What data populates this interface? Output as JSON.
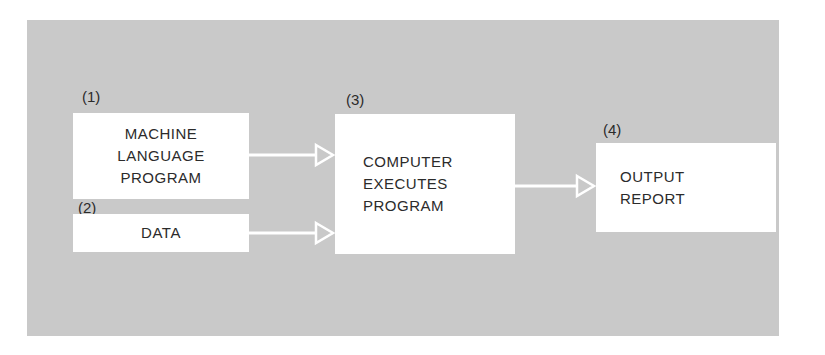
{
  "diagram": {
    "type": "flowchart",
    "background_color": "#c9c9c9",
    "box_color": "#ffffff",
    "arrow_color": "#ffffff",
    "nodes": [
      {
        "id": "1",
        "number": "(1)",
        "lines": [
          "MACHINE",
          "LANGUAGE",
          "PROGRAM"
        ]
      },
      {
        "id": "2",
        "number": "(2)",
        "lines": [
          "DATA"
        ]
      },
      {
        "id": "3",
        "number": "(3)",
        "lines": [
          "COMPUTER",
          "EXECUTES",
          "PROGRAM"
        ]
      },
      {
        "id": "4",
        "number": "(4)",
        "lines": [
          "OUTPUT",
          "REPORT"
        ]
      }
    ],
    "edges": [
      {
        "from": "1",
        "to": "3"
      },
      {
        "from": "2",
        "to": "3"
      },
      {
        "from": "3",
        "to": "4"
      }
    ]
  }
}
